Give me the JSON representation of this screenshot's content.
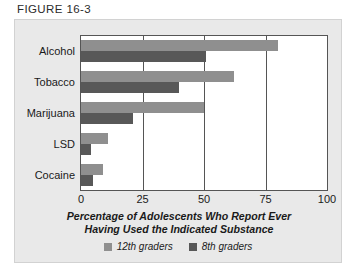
{
  "figure": {
    "number_label": "FIGURE 16-3"
  },
  "chart_data": {
    "type": "bar",
    "orientation": "horizontal",
    "title": "",
    "xlabel": "Percentage of Adolescents Who Report Ever Having Used the Indicated Substance",
    "xlabel_line1": "Percentage of Adolescents Who Report Ever",
    "xlabel_line2": "Having Used the Indicated Substance",
    "ylabel": "",
    "categories": [
      "Alcohol",
      "Tobacco",
      "Marijuana",
      "LSD",
      "Cocaine"
    ],
    "series": [
      {
        "name": "12th graders",
        "color": "#8f8f8f",
        "values": [
          80,
          62,
          50,
          11,
          9
        ]
      },
      {
        "name": "8th graders",
        "color": "#585858",
        "values": [
          51,
          40,
          21,
          4,
          5
        ]
      }
    ],
    "xlim": [
      0,
      100
    ],
    "xticks": [
      0,
      25,
      50,
      75,
      100
    ],
    "xtick_labels": [
      "0",
      "25",
      "50",
      "75",
      "100"
    ],
    "gridlines": [
      25,
      50,
      75
    ],
    "grid": true,
    "legend_position": "bottom-center"
  },
  "legend": {
    "items": [
      {
        "label": "12th graders",
        "color": "#8f8f8f"
      },
      {
        "label": "8th graders",
        "color": "#585858"
      }
    ]
  },
  "colors": {
    "panel_background": "#e9e9e9",
    "plot_background": "#ffffff",
    "axis": "#555555",
    "text": "#1a1a1a"
  }
}
